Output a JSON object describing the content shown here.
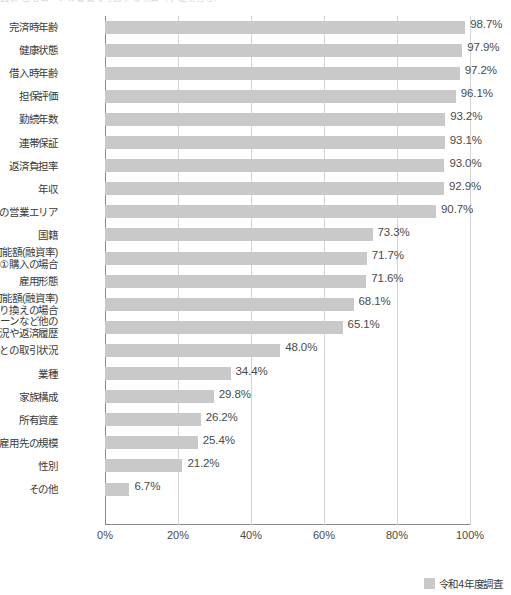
{
  "title_strip": {
    "text": "図表 住宅ローンの審査で考慮する項目（予定を含む）"
  },
  "legend": {
    "label": "令和4年度調査",
    "color": "#c9c9c9"
  },
  "axis": {
    "ticks": [
      "0%",
      "20%",
      "40%",
      "60%",
      "80%",
      "100%"
    ]
  },
  "chart_data": {
    "type": "bar",
    "orientation": "horizontal",
    "title": "図表 住宅ローンの審査で考慮する項目（予定を含む）",
    "xlabel": "",
    "ylabel": "",
    "xlim": [
      0,
      100
    ],
    "xticks": [
      0,
      20,
      40,
      60,
      80,
      100
    ],
    "grid": true,
    "legend_position": "bottom-right",
    "series": [
      {
        "name": "令和4年度調査",
        "color": "#c9c9c9",
        "values": [
          98.7,
          97.9,
          97.2,
          96.1,
          93.2,
          93.1,
          93.0,
          92.9,
          90.7,
          73.3,
          71.7,
          71.6,
          68.1,
          65.1,
          48.0,
          34.4,
          29.8,
          26.2,
          25.4,
          21.2,
          6.7
        ]
      }
    ],
    "categories": [
      "完済時年齢",
      "健康状態",
      "借入時年齢",
      "担保評価",
      "勤続年数",
      "連帯保証",
      "返済負担率",
      "年収",
      "金融機関の営業エリア",
      "国籍",
      "融資可能額(融資率)\n①購入の場合",
      "雇用形態",
      "融資可能額(融資率)\n②借り換えの場合",
      "カードローンなど他の\n債務の状況や返済履歴",
      "申込人との取引状況",
      "業種",
      "家族構成",
      "所有資産",
      "雇用先の規模",
      "性別",
      "その他"
    ],
    "data_labels": [
      "98.7%",
      "97.9%",
      "97.2%",
      "96.1%",
      "93.2%",
      "93.1%",
      "93.0%",
      "92.9%",
      "90.7%",
      "73.3%",
      "71.7%",
      "71.6%",
      "68.1%",
      "65.1%",
      "48.0%",
      "34.4%",
      "29.8%",
      "26.2%",
      "25.4%",
      "21.2%",
      "6.7%"
    ]
  }
}
